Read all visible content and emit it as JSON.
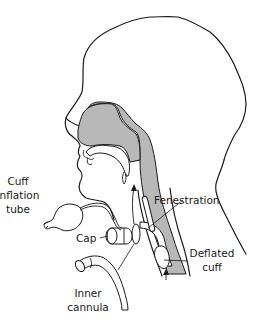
{
  "diagram": {
    "labels": {
      "cuff_inflation_tube": [
        "Cuff",
        "inflation",
        "tube"
      ],
      "cap": "Cap",
      "fenestration": "Fenestration",
      "deflated_cuff": [
        "Deflated",
        "cuff"
      ],
      "inner_cannula": [
        "Inner",
        "cannula"
      ]
    },
    "colors": {
      "airway_shading": "#b8b8b8",
      "line": "#1a1a1a",
      "background": "#ffffff"
    }
  }
}
